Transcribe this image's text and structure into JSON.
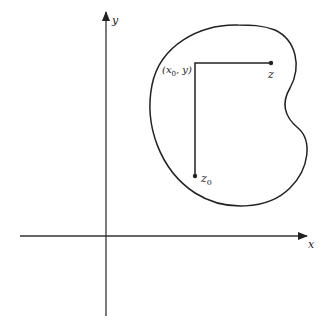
{
  "diagram": {
    "type": "complex-plane path diagram",
    "axes": {
      "x_label": "x",
      "y_label": "y"
    },
    "region": {
      "description": "closed kidney-shaped region"
    },
    "points": {
      "z0": {
        "label": "z",
        "subscript": "0"
      },
      "z": {
        "label": "z"
      },
      "corner": {
        "label_prefix": "(x",
        "label_sub": "0",
        "label_suffix": ", y)"
      }
    },
    "path": {
      "description": "vertical segment from z0 up to (x0, y), then horizontal segment to z"
    },
    "colors": {
      "ink": "#222222",
      "axis": "#333333",
      "background": "#ffffff"
    }
  }
}
